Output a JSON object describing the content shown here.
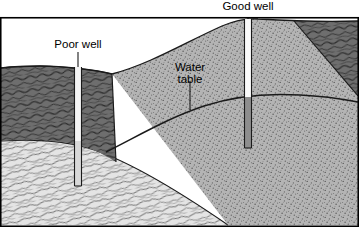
{
  "figure": {
    "type": "geological-cross-section",
    "width": 359,
    "height": 227,
    "background": "#ffffff",
    "border_color": "#000000"
  },
  "labels": {
    "poor_well": "Poor well",
    "good_well": "Good well",
    "water_table_line1": "Water",
    "water_table_line2": "table"
  },
  "colors": {
    "till_dark": "#6e6e6e",
    "till_dark_lines": "#2a2a2a",
    "bedrock_light": "#e2e2e2",
    "bedrock_lines": "#6a6a6a",
    "sand_stipple_bg": "#b4b4b4",
    "sand_stipple_dot": "#5d5d5d",
    "well_empty": "#f2f2f2",
    "well_water": "#8e8e8e",
    "outline": "#1a1a1a",
    "water_table_line": "#1a1a1a"
  },
  "layers": [
    {
      "name": "glacial-till-dark",
      "pattern": "wavy-lines",
      "shade": "dark-gray",
      "description": "Dark fine-grained low-permeability layer at upper left sloping down to the right, plus a wedge in the upper right corner"
    },
    {
      "name": "bedrock-shale-light",
      "pattern": "wavy-lines",
      "shade": "light-gray",
      "description": "Light impermeable bedrock occupying the lower left, sloping down toward the right and meeting the base near x=228"
    },
    {
      "name": "sand-aquifer",
      "pattern": "stipple-dots",
      "shade": "medium-gray",
      "description": "Permeable stippled sand aquifer filling the center and right of the section"
    }
  ],
  "wells": [
    {
      "id": "poor-well",
      "label": "Poor well",
      "x": 78,
      "top_y": 68,
      "bottom_y": 186,
      "casing_width": 7,
      "water_level_y": null,
      "status": "dry",
      "note": "Cased through the dark low-permeability layer and bottomed in impermeable bedrock above the water table"
    },
    {
      "id": "good-well",
      "label": "Good well",
      "x": 248,
      "top_y": 18,
      "bottom_y": 148,
      "casing_width": 7,
      "water_level_y": 98,
      "status": "productive",
      "note": "Penetrates the sand aquifer well below the water table; the lower part of the casing is filled with water"
    }
  ],
  "water_table": {
    "label": "Water table",
    "leader_line": {
      "x": 190,
      "y_top": 80,
      "y_bottom": 108
    },
    "description": "Curved dark line rising from lower left across the section and cresting toward the right"
  }
}
